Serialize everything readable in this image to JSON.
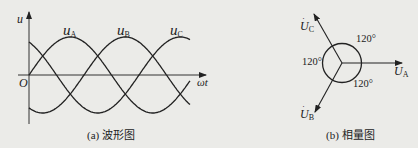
{
  "waveform": {
    "axis_y_label": "u",
    "axis_x_label": "ωt",
    "origin_label": "O",
    "series": [
      {
        "name": "u",
        "sub": "A",
        "phase_deg": 0
      },
      {
        "name": "u",
        "sub": "B",
        "phase_deg": -120
      },
      {
        "name": "u",
        "sub": "C",
        "phase_deg": 120
      }
    ],
    "caption": "(a) 波形图"
  },
  "phasor": {
    "phasors": [
      {
        "name": "U",
        "sub": "A",
        "angle_deg": 0
      },
      {
        "name": "U",
        "sub": "B",
        "angle_deg": -120
      },
      {
        "name": "U",
        "sub": "C",
        "angle_deg": 120
      }
    ],
    "angle_labels": [
      "120°",
      "120°",
      "120°"
    ],
    "caption": "(b) 相量图"
  },
  "colors": {
    "line": "#222222",
    "background": "#ebebe8"
  }
}
